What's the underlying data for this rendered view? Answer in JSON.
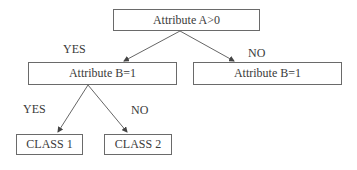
{
  "diagram": {
    "type": "decision-tree",
    "nodes": {
      "root": {
        "label": "Attribute A>0"
      },
      "left": {
        "label": "Attribute B=1"
      },
      "right": {
        "label": "Attribute B=1"
      },
      "class1": {
        "label": "CLASS 1"
      },
      "class2": {
        "label": "CLASS 2"
      }
    },
    "edges": {
      "root_left": {
        "label": "YES"
      },
      "root_right": {
        "label": "NO"
      },
      "left_class1": {
        "label": "YES"
      },
      "left_class2": {
        "label": "NO"
      }
    },
    "colors": {
      "stroke": "#6a6a6a",
      "text": "#3a3a3a"
    }
  }
}
